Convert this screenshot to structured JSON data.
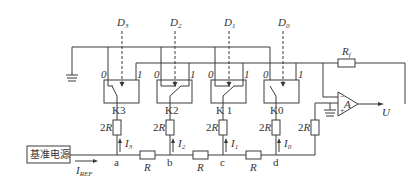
{
  "diagram": {
    "type": "R-2R ladder D/A converter circuit",
    "inputs": [
      {
        "name": "D",
        "sub": "3"
      },
      {
        "name": "D",
        "sub": "2"
      },
      {
        "name": "D",
        "sub": "1"
      },
      {
        "name": "D",
        "sub": "0"
      }
    ],
    "switches": [
      {
        "label": "K3",
        "pos0": "0",
        "pos1": "1"
      },
      {
        "label": "K2",
        "pos0": "0",
        "pos1": "1"
      },
      {
        "label": "K 1",
        "pos0": "0",
        "pos1": "1"
      },
      {
        "label": "K0",
        "pos0": "0",
        "pos1": "1"
      }
    ],
    "branch_resistors": [
      "2R",
      "2R",
      "2R",
      "2R",
      "2R"
    ],
    "ladder_resistors": [
      "R",
      "R",
      "R"
    ],
    "nodes": [
      "a",
      "b",
      "c",
      "d"
    ],
    "branch_currents": [
      {
        "name": "I",
        "sub": "3"
      },
      {
        "name": "I",
        "sub": "2"
      },
      {
        "name": "I",
        "sub": "1"
      },
      {
        "name": "I",
        "sub": "0"
      }
    ],
    "reference_source": "基准电源",
    "reference_current": {
      "name": "I",
      "sub": "REF"
    },
    "feedback_resistor": {
      "name": "R",
      "sub": "f"
    },
    "opamp": {
      "label": "A",
      "inverting": "−",
      "noninverting": "+"
    },
    "output": "U"
  }
}
